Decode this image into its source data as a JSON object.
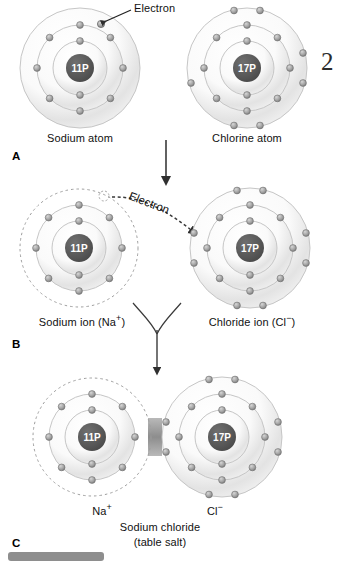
{
  "figure": {
    "number": "2",
    "title_caption": "Sodium chloride",
    "subtitle_caption": "(table salt)"
  },
  "colors": {
    "nucleus_fill": "#5a5a5a",
    "nucleus_text": "#ffffff",
    "electron_fill": "#9a9a9a",
    "electron_stroke": "#5e5e5e",
    "shell_stroke": "#bdbdbd",
    "shell_highlight": "#f2f2f2",
    "arrow": "#3a3a3a",
    "dashed_shell": "#9a9a9a",
    "label_text": "#111111",
    "bottom_bar": "#8e8e8e"
  },
  "panels": [
    {
      "letter": "A",
      "annotation": "Electron",
      "atoms": [
        {
          "name": "sodium-atom",
          "label": "Sodium atom",
          "nucleus": "11P",
          "shell_counts": [
            2,
            8,
            1
          ],
          "outer_shell_dashed": false
        },
        {
          "name": "chlorine-atom",
          "label": "Chlorine atom",
          "nucleus": "17P",
          "shell_counts": [
            2,
            8,
            7
          ],
          "outer_shell_dashed": false
        }
      ]
    },
    {
      "letter": "B",
      "annotation": "Electron",
      "atoms": [
        {
          "name": "sodium-ion",
          "label": "Sodium ion (Na+)",
          "label_base": "Sodium ion (Na",
          "label_charge": "+",
          "label_tail": ")",
          "nucleus": "11P",
          "shell_counts": [
            2,
            8
          ],
          "outer_shell_dashed": true
        },
        {
          "name": "chloride-ion",
          "label": "Chloride ion (Cl−)",
          "label_base": "Chloride ion (Cl",
          "label_charge": "−",
          "label_tail": ")",
          "nucleus": "17P",
          "shell_counts": [
            2,
            8,
            8
          ],
          "outer_shell_dashed": false
        }
      ]
    },
    {
      "letter": "C",
      "caption_line1": "Sodium chloride",
      "caption_line2": "(table salt)",
      "atoms": [
        {
          "name": "sodium-ion-bonded",
          "label": "Na+",
          "label_base": "Na",
          "label_charge": "+",
          "nucleus": "11P",
          "shell_counts": [
            2,
            8
          ],
          "outer_shell_dashed": true
        },
        {
          "name": "chloride-ion-bonded",
          "label": "Cl−",
          "label_base": "Cl",
          "label_charge": "−",
          "nucleus": "17P",
          "shell_counts": [
            2,
            8,
            8
          ],
          "outer_shell_dashed": false
        }
      ]
    }
  ]
}
